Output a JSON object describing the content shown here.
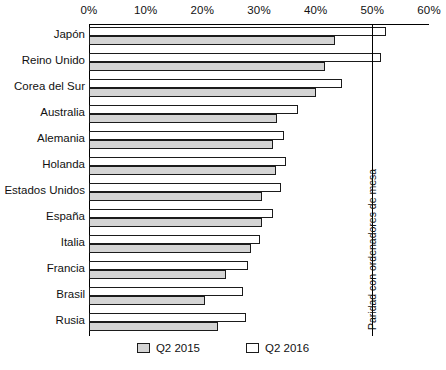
{
  "chart_data": {
    "type": "bar",
    "orientation": "horizontal",
    "title": "",
    "xlabel": "",
    "ylabel": "",
    "xlim": [
      0,
      60
    ],
    "xtick_labels": [
      "0%",
      "10%",
      "20%",
      "30%",
      "40%",
      "50%",
      "60%"
    ],
    "xticks": [
      0,
      10,
      20,
      30,
      40,
      50,
      60
    ],
    "grid": false,
    "legend_position": "bottom",
    "categories": [
      "Japón",
      "Reino Unido",
      "Corea del Sur",
      "Australia",
      "Alemania",
      "Holanda",
      "Estados Unidos",
      "España",
      "Italia",
      "Francia",
      "Brasil",
      "Rusia"
    ],
    "series": [
      {
        "name": "Q2 2016",
        "color": "#ffffff",
        "values": [
          52.4,
          51.5,
          44.6,
          36.9,
          34.4,
          34.7,
          33.9,
          32.5,
          30.1,
          28.0,
          27.2,
          27.7
        ]
      },
      {
        "name": "Q2 2015",
        "color": "#d4d4d4",
        "values": [
          43.4,
          41.6,
          40.0,
          33.2,
          32.4,
          33.0,
          30.5,
          30.5,
          28.6,
          24.2,
          20.5,
          22.8
        ]
      }
    ],
    "annotations": [
      {
        "text": "Paridad con ordenadores de mesa",
        "value": 50,
        "orientation": "vertical-line"
      }
    ]
  },
  "legend": {
    "items": [
      {
        "label": "Q2 2015",
        "swatch": "gray-swatch"
      },
      {
        "label": "Q2 2016",
        "swatch": "white-swatch"
      }
    ]
  }
}
